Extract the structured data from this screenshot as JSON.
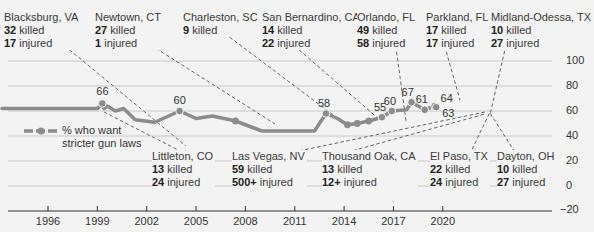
{
  "chart_data": {
    "type": "line",
    "title": "",
    "xlabel": "",
    "ylabel": "",
    "ylim": [
      -20,
      100
    ],
    "y_ticks": [
      "100",
      "80",
      "60",
      "40",
      "20",
      "0",
      "−20"
    ],
    "x_ticks": [
      "1996",
      "1999",
      "2002",
      "2005",
      "2008",
      "2011",
      "2014",
      "2017",
      "2020"
    ],
    "grid": true,
    "legend": {
      "label_line1": "% who want",
      "label_line2": "stricter gun laws",
      "position": "left"
    },
    "series": [
      {
        "name": "% who want stricter gun laws",
        "color": "#8c8c8c",
        "points": [
          {
            "x": 1993.2,
            "y": 62
          },
          {
            "x": 1999.0,
            "y": 62
          },
          {
            "x": 1999.3,
            "y": 66
          },
          {
            "x": 1999.4,
            "y": 62
          },
          {
            "x": 1999.6,
            "y": 64
          },
          {
            "x": 2000.1,
            "y": 60
          },
          {
            "x": 2000.6,
            "y": 62
          },
          {
            "x": 2001.3,
            "y": 53
          },
          {
            "x": 2002.5,
            "y": 51
          },
          {
            "x": 2004.0,
            "y": 60
          },
          {
            "x": 2005.0,
            "y": 54
          },
          {
            "x": 2006.0,
            "y": 56
          },
          {
            "x": 2007.4,
            "y": 52
          },
          {
            "x": 2009.0,
            "y": 44
          },
          {
            "x": 2011.0,
            "y": 44
          },
          {
            "x": 2012.2,
            "y": 44
          },
          {
            "x": 2012.9,
            "y": 58
          },
          {
            "x": 2013.6,
            "y": 54
          },
          {
            "x": 2014.2,
            "y": 49
          },
          {
            "x": 2014.8,
            "y": 50
          },
          {
            "x": 2015.5,
            "y": 52
          },
          {
            "x": 2016.3,
            "y": 55
          },
          {
            "x": 2016.9,
            "y": 60
          },
          {
            "x": 2017.8,
            "y": 61
          },
          {
            "x": 2018.1,
            "y": 67
          },
          {
            "x": 2018.9,
            "y": 61
          },
          {
            "x": 2019.5,
            "y": 64
          },
          {
            "x": 2019.6,
            "y": 63
          }
        ],
        "labeled_values": [
          {
            "x": 1993.2,
            "y": 62,
            "label": "62"
          },
          {
            "x": 1999.3,
            "y": 66,
            "label": "66"
          },
          {
            "x": 2004.0,
            "y": 60,
            "label": "60"
          },
          {
            "x": 2012.9,
            "y": 58,
            "label": "58"
          },
          {
            "x": 2016.3,
            "y": 55,
            "label": "55"
          },
          {
            "x": 2016.9,
            "y": 60,
            "label": "60"
          },
          {
            "x": 2018.1,
            "y": 67,
            "label": "67"
          },
          {
            "x": 2018.9,
            "y": 61,
            "label": "61"
          },
          {
            "x": 2019.5,
            "y": 64,
            "label": "64"
          },
          {
            "x": 2019.6,
            "y": 63,
            "label": "63"
          }
        ]
      }
    ],
    "annotations": [
      {
        "place": "Blacksburg, VA",
        "killed": "32",
        "injured": "17",
        "position": "top"
      },
      {
        "place": "Newtown, CT",
        "killed": "27",
        "injured": "1",
        "position": "top"
      },
      {
        "place": "Charleston, SC",
        "killed": "9",
        "injured": "",
        "position": "top"
      },
      {
        "place": "San Bernardino, CA",
        "killed": "14",
        "injured": "22",
        "position": "top"
      },
      {
        "place": "Orlando, FL",
        "killed": "49",
        "injured": "58",
        "position": "top"
      },
      {
        "place": "Parkland, FL",
        "killed": "17",
        "injured": "17",
        "position": "top"
      },
      {
        "place": "Midland-Odessa, TX",
        "killed": "10",
        "injured": "27",
        "position": "top"
      },
      {
        "place": "Littleton, CO",
        "killed": "13",
        "injured": "24",
        "position": "bottom"
      },
      {
        "place": "Las Vegas, NV",
        "killed": "59",
        "injured": "500+",
        "position": "bottom"
      },
      {
        "place": "Thousand Oak, CA",
        "killed": "13",
        "injured": "12+",
        "position": "bottom"
      },
      {
        "place": "El Paso, TX",
        "killed": "22",
        "injured": "24",
        "position": "bottom"
      },
      {
        "place": "Dayton, OH",
        "killed": "10",
        "injured": "27",
        "position": "bottom"
      }
    ]
  },
  "words": {
    "killed": "killed",
    "injured": "injured"
  }
}
